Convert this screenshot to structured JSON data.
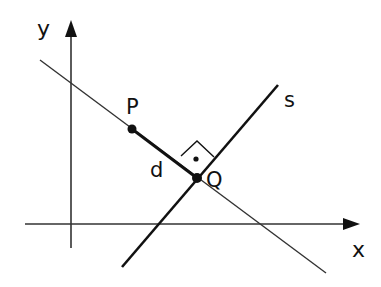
{
  "diagram": {
    "type": "geometry",
    "axes": {
      "x_label": "x",
      "y_label": "y"
    },
    "points": {
      "P": {
        "label": "P",
        "x": 132,
        "y": 129
      },
      "Q": {
        "label": "Q",
        "x": 197,
        "y": 178
      }
    },
    "lines": {
      "s": {
        "label": "s"
      },
      "distance": {
        "label": "d"
      }
    },
    "right_angle_marker": true,
    "colors": {
      "stroke": "#111111",
      "background": "#ffffff"
    }
  }
}
